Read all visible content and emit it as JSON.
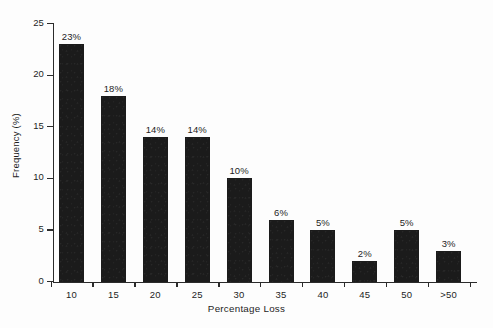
{
  "chart_data": {
    "type": "bar",
    "title": "",
    "subtitle": "",
    "xlabel": "Percentage Loss",
    "ylabel": "Frequency (%)",
    "categories": [
      "10",
      "15",
      "20",
      "25",
      "30",
      "35",
      "40",
      "45",
      "50",
      ">50"
    ],
    "values": [
      23,
      18,
      14,
      14,
      10,
      6,
      5,
      2,
      5,
      3
    ],
    "data_labels": [
      "23%",
      "18%",
      "14%",
      "14%",
      "10%",
      "6%",
      "5%",
      "2%",
      "5%",
      "3%"
    ],
    "ylim": [
      0,
      25
    ],
    "y_ticks": [
      0,
      5,
      10,
      15,
      20,
      25
    ],
    "y_tick_labels": [
      "0",
      "5",
      "10",
      "15",
      "20",
      "25"
    ],
    "xlim_categories": 10,
    "grid": false,
    "legend": null,
    "legend_position": "none",
    "series": [
      {
        "name": "Frequency",
        "values": [
          23,
          18,
          14,
          14,
          10,
          6,
          5,
          2,
          5,
          3
        ]
      }
    ],
    "colors": {
      "bar_fill": "#1b1b1b",
      "axis": "#2b2b2b",
      "text": "#1d1d1d",
      "background": "#fdfdfd"
    }
  }
}
